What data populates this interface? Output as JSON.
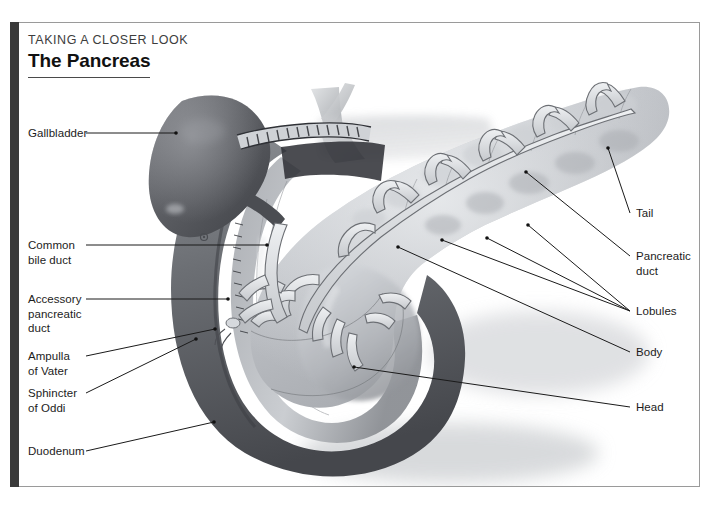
{
  "header": {
    "kicker": "TAKING A CLOSER LOOK",
    "title": "The Pancreas"
  },
  "labels": {
    "gallbladder": "Gallbladder",
    "common_bile_duct": "Common\nbile duct",
    "accessory_pancreatic_duct": "Accessory\npancreatic\nduct",
    "ampulla_of_vater": "Ampulla\nof Vater",
    "sphincter_of_oddi": "Sphincter\nof Oddi",
    "duodenum": "Duodenum",
    "tail": "Tail",
    "pancreatic_duct": "Pancreatic\nduct",
    "lobules": "Lobules",
    "body": "Body",
    "head": "Head"
  },
  "figure": {
    "type": "anatomical-illustration",
    "subject": "pancreas",
    "style": "grayscale medical illustration",
    "structures": [
      "gallbladder",
      "duodenum",
      "pancreas head",
      "pancreas body",
      "pancreas tail",
      "pancreatic duct tree",
      "common bile duct",
      "accessory pancreatic duct",
      "ampulla of Vater",
      "sphincter of Oddi",
      "lobules"
    ]
  },
  "colors": {
    "frame": "#9a9a9a",
    "left_bar": "#3a3a3a",
    "title_text": "#111111",
    "kicker_text": "#3d3d3d",
    "label_text": "#1c1c1c",
    "leader_line": "#1a1a1a",
    "gallbladder": "#5f6166",
    "duodenum": "#6f7176",
    "pancreas": "#b9bcc0",
    "background": "#ffffff"
  }
}
